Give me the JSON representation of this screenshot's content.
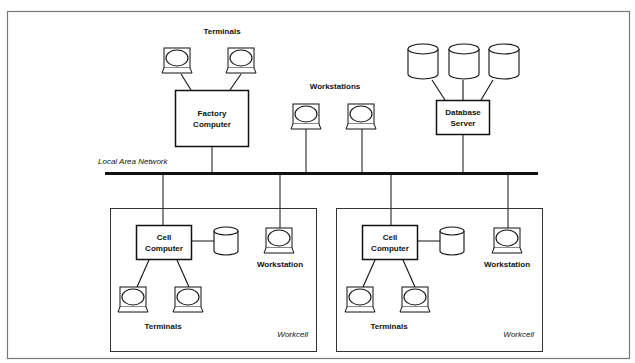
{
  "diagram": {
    "type": "network-architecture",
    "network": {
      "label": "Local Area Network"
    },
    "top_level": {
      "factory_computer": {
        "label_line1": "Factory",
        "label_line2": "Computer"
      },
      "factory_terminals": {
        "label": "Terminals",
        "count": 2
      },
      "workstations": {
        "label": "Workstations",
        "count": 2
      },
      "database_server": {
        "label_line1": "Database",
        "label_line2": "Server",
        "disks": 3
      }
    },
    "workcells": [
      {
        "label": "Workcell",
        "cell_computer": {
          "label_line1": "Cell",
          "label_line2": "Computer"
        },
        "workstation": {
          "label": "Workstation"
        },
        "terminals": {
          "label": "Terminals",
          "count": 2
        },
        "disk": 1
      },
      {
        "label": "Workcell",
        "cell_computer": {
          "label_line1": "Cell",
          "label_line2": "Computer"
        },
        "workstation": {
          "label": "Workstation"
        },
        "terminals": {
          "label": "Terminals",
          "count": 2
        },
        "disk": 1
      }
    ],
    "colors": {
      "line": "#111111",
      "frame": "#777777",
      "background": "#ffffff"
    }
  }
}
